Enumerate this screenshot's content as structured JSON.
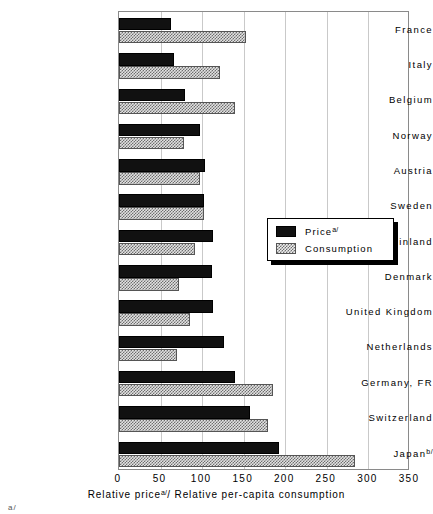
{
  "chart_data": {
    "type": "bar",
    "orientation": "horizontal",
    "title": "",
    "xlabel": "Relative price<sup>a/</sup>/ Relative per-capita consumption",
    "xlabel_text": "Relative price",
    "xlabel_sup": "a/",
    "xlabel_text2": "/ Relative per-capita consumption",
    "ylabel": "",
    "xlim": [
      0,
      350
    ],
    "xticks": [
      0,
      50,
      100,
      150,
      200,
      250,
      300,
      350
    ],
    "grid": true,
    "grid_axis": "x",
    "legend_position": "center-right",
    "categories": [
      "France",
      "Italy",
      "Belgium",
      "Norway",
      "Austria",
      "Sweden",
      "Finland",
      "Denmark",
      "United Kingdom",
      "Netherlands",
      "Germany, FR",
      "Switzerland",
      "Japan"
    ],
    "category_superscripts": {
      "Japan": "b/"
    },
    "series": [
      {
        "name": "Price",
        "name_superscript": "a/",
        "fill": "solid-black",
        "color": "#111111",
        "values": [
          62,
          66,
          79,
          98,
          103,
          102,
          113,
          112,
          113,
          126,
          139,
          157,
          192
        ]
      },
      {
        "name": "Consumption",
        "name_superscript": "",
        "fill": "crosshatch-grey",
        "color": "#b8b8b8",
        "values": [
          153,
          122,
          140,
          78,
          98,
          102,
          91,
          72,
          85,
          70,
          185,
          179,
          284
        ]
      }
    ]
  },
  "legend": {
    "items": [
      {
        "label": "Price",
        "sup": "a/"
      },
      {
        "label": "Consumption",
        "sup": ""
      }
    ]
  },
  "footnote_mark": "a/"
}
